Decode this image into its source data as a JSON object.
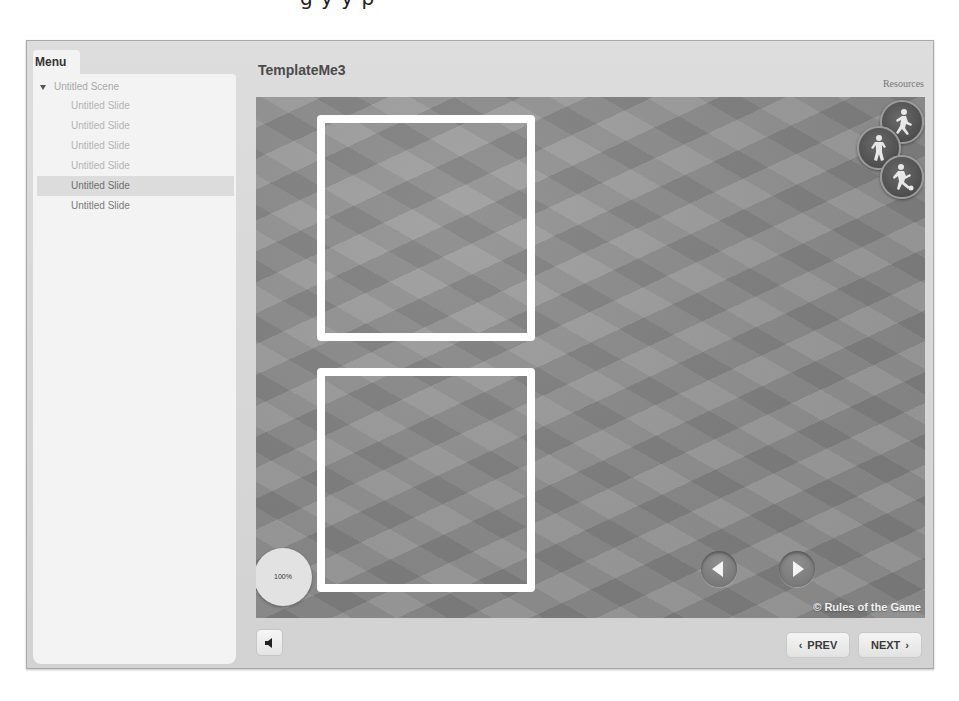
{
  "page": {
    "cutoff_header_text": "g                                   y  y  p"
  },
  "sidebar": {
    "tab_label": "Menu",
    "scene": {
      "label": "Untitled Scene",
      "expanded": true
    },
    "items": [
      {
        "label": "Untitled Slide",
        "state": "visited"
      },
      {
        "label": "Untitled Slide",
        "state": "visited"
      },
      {
        "label": "Untitled Slide",
        "state": "visited"
      },
      {
        "label": "Untitled Slide",
        "state": "visited"
      },
      {
        "label": "Untitled Slide",
        "state": "active"
      },
      {
        "label": "Untitled Slide",
        "state": "normal"
      }
    ]
  },
  "header": {
    "title": "TemplateMe3",
    "resources_label": "Resources"
  },
  "slide": {
    "zoom_level": "100%",
    "copyright": "© Rules of the Game",
    "drop_boxes": [
      {
        "id": "top"
      },
      {
        "id": "bottom"
      }
    ],
    "sport_icons": [
      "runner-icon",
      "basketball-player-icon",
      "soccer-player-icon"
    ]
  },
  "toolbar": {
    "prev_label": "PREV",
    "next_label": "NEXT",
    "prev_chevron": "‹",
    "next_chevron": "›"
  },
  "colors": {
    "frame_bg": "#d6d6d6",
    "panel_bg": "#f3f3f3",
    "active_item_bg": "#dcdcdc",
    "slide_bg": "#8d8d8d",
    "box_border": "#ffffff"
  }
}
